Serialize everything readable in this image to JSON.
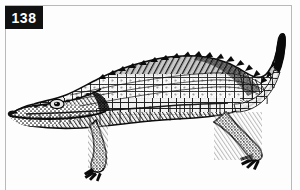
{
  "plate": {
    "figure_number": "138",
    "subject": "crocodile",
    "illustration_style": "black-and-white stipple engraving",
    "orientation": "head at left, tail curving up at right",
    "background_color": "#fdfdfd",
    "ink_color": "#111111",
    "frame_color": "#b9b9b9",
    "tag_background_color": "#111111",
    "tag_text_color": "#ffffff",
    "icons": {
      "figure_tag": "number-plate-icon",
      "animal": "crocodile-icon"
    }
  }
}
